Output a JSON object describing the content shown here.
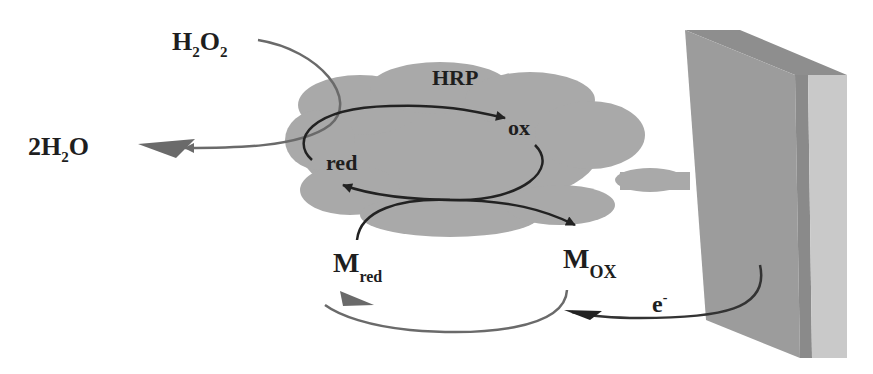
{
  "diagram": {
    "colors": {
      "cloud": "#a9a9a9",
      "electrode_front": "#9c9c9c",
      "electrode_side": "#c9c9c9",
      "electrode_top": "#8e8e8e",
      "dark_arrow": "#222222",
      "gray_arrow": "#6a6a6a",
      "text": "#1e1e1e"
    },
    "labels": {
      "h2o2": {
        "base": "H",
        "sub1": "2",
        "mid": "O",
        "sub2": "2"
      },
      "water": {
        "coef": "2H",
        "sub": "2",
        "tail": "O"
      },
      "enzyme": "HRP",
      "enzyme_ox": "ox",
      "enzyme_red": "red",
      "mediator_red": {
        "base": "M",
        "sub": "red"
      },
      "mediator_ox": {
        "base": "M",
        "sub": "OX"
      },
      "electron": {
        "base": "e",
        "sup": "-"
      }
    },
    "nodes": [
      "H2O2",
      "2H2O",
      "HRP(ox)",
      "HRP(red)",
      "M_red",
      "M_ox",
      "electrode",
      "e-"
    ],
    "edges": [
      {
        "from": "H2O2",
        "to": "2H2O",
        "via": "HRP"
      },
      {
        "from": "HRP(red)",
        "to": "HRP(ox)"
      },
      {
        "from": "HRP(ox)",
        "to": "HRP(red)",
        "coupled_with": "M_red -> M_ox"
      },
      {
        "from": "M_red",
        "to": "M_ox"
      },
      {
        "from": "electrode",
        "to": "M_ox",
        "label": "e-"
      },
      {
        "from": "M_ox",
        "to": "M_red"
      }
    ]
  }
}
